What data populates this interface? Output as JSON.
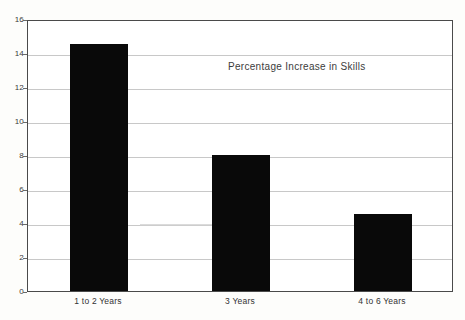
{
  "chart_data": {
    "type": "bar",
    "title": "Percentage Increase in Skills",
    "xlabel": "",
    "ylabel": "",
    "categories": [
      "1 to 2 Years",
      "3 Years",
      "4 to 6 Years"
    ],
    "values": [
      14.5,
      8,
      4.5
    ],
    "ylim": [
      0,
      16
    ],
    "y_ticks": [
      0,
      2,
      4,
      6,
      8,
      10,
      12,
      14,
      16
    ],
    "y_tick_labels": [
      "0",
      "2",
      "4",
      "6",
      "8",
      "10",
      "12",
      "14",
      "16"
    ],
    "grid": true,
    "legend": "none",
    "bar_color": "#090909",
    "gridline_color": "#c8c8c8",
    "frame_color": "#4a4a4a",
    "background_color": "#ffffff"
  },
  "figure": {
    "page_background": "#fdfdfb"
  }
}
